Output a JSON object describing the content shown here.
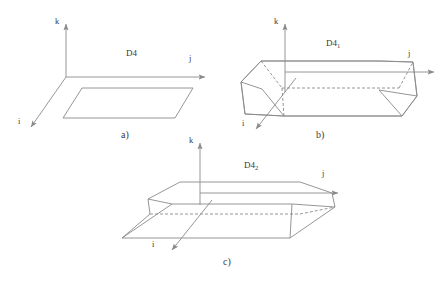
{
  "figure": {
    "background_color": "#ffffff",
    "line_color": "#8a8a8a",
    "text_color": "#3a3a3a",
    "dash_pattern": "3,2"
  },
  "panels": [
    {
      "id": "a",
      "caption": "a)",
      "region_label": "D4",
      "region_sub": "",
      "shape": "parallelogram",
      "axes": [
        {
          "name": "k",
          "label": "k",
          "direction": "up"
        },
        {
          "name": "j",
          "label": "j",
          "direction": "right"
        },
        {
          "name": "i",
          "label": "i",
          "direction": "down-left"
        }
      ]
    },
    {
      "id": "b",
      "caption": "b)",
      "region_label": "D4",
      "region_sub": "1",
      "shape": "box",
      "axes": [
        {
          "name": "k",
          "label": "k",
          "direction": "up"
        },
        {
          "name": "j",
          "label": "j",
          "direction": "right"
        },
        {
          "name": "i",
          "label": "i",
          "direction": "down-left"
        }
      ]
    },
    {
      "id": "c",
      "caption": "c)",
      "region_label": "D4",
      "region_sub": "2",
      "shape": "flat-box",
      "axes": [
        {
          "name": "k",
          "label": "k",
          "direction": "up"
        },
        {
          "name": "j",
          "label": "j",
          "direction": "right"
        },
        {
          "name": "i",
          "label": "i",
          "direction": "down-left"
        }
      ]
    }
  ],
  "labels": {
    "panel_a": {
      "k": "k",
      "j": "j",
      "i": "i",
      "region": "D4",
      "caption": "a)"
    },
    "panel_b": {
      "k": "k",
      "j": "j",
      "i": "i",
      "region": "D4",
      "region_sub": "1",
      "caption": "b)"
    },
    "panel_c": {
      "k": "k",
      "j": "j",
      "i": "i",
      "region": "D4",
      "region_sub": "2",
      "caption": "c)"
    }
  }
}
